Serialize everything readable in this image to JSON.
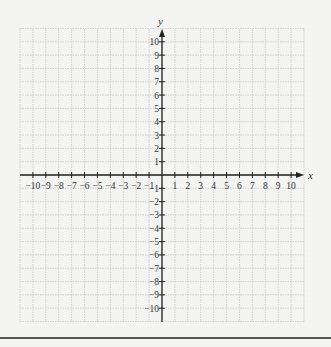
{
  "chart_data": {
    "type": "coordinate-grid",
    "title": "",
    "xlabel": "x",
    "ylabel": "y",
    "xlim": [
      -11,
      11
    ],
    "ylim": [
      -11,
      11
    ],
    "grid": true,
    "x_ticks": [
      -10,
      -9,
      -8,
      -7,
      -6,
      -5,
      -4,
      -3,
      -2,
      -1,
      1,
      2,
      3,
      4,
      5,
      6,
      7,
      8,
      9,
      10
    ],
    "y_ticks": [
      10,
      9,
      8,
      7,
      6,
      5,
      4,
      3,
      2,
      1,
      -1,
      -2,
      -3,
      -4,
      -5,
      -6,
      -7,
      -8,
      -9,
      -10
    ],
    "series": []
  },
  "colors": {
    "background": "#f4f4f2",
    "grid": "#c8c8c8",
    "axis": "#222222",
    "text": "#333333"
  }
}
